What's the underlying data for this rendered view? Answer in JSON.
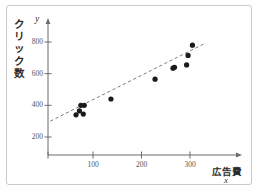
{
  "chart_data": {
    "type": "scatter",
    "title": "",
    "xlabel": "広告費",
    "xvar": "x",
    "ylabel": "クリック数",
    "yvar": "y",
    "ylabel_chars": [
      "ク",
      "リ",
      "ッ",
      "ク",
      "数"
    ],
    "xlim": [
      0,
      340
    ],
    "ylim": [
      0,
      900
    ],
    "xticks": [
      100,
      200,
      300
    ],
    "xticklabels": [
      "100",
      "200",
      "300"
    ],
    "yticks": [
      200,
      400,
      600,
      800
    ],
    "yticklabels": [
      "200",
      "400",
      "600",
      "800"
    ],
    "grid": false,
    "legend": null,
    "point_color": "#1a1a1a",
    "line_color": "#7a7a7a",
    "axis_color": "#6b6b6b",
    "points": [
      {
        "x": 65,
        "y": 340
      },
      {
        "x": 72,
        "y": 365
      },
      {
        "x": 75,
        "y": 400
      },
      {
        "x": 80,
        "y": 345
      },
      {
        "x": 82,
        "y": 400
      },
      {
        "x": 137,
        "y": 440
      },
      {
        "x": 228,
        "y": 565
      },
      {
        "x": 265,
        "y": 635
      },
      {
        "x": 268,
        "y": 640
      },
      {
        "x": 293,
        "y": 655
      },
      {
        "x": 296,
        "y": 715
      },
      {
        "x": 305,
        "y": 780
      }
    ],
    "trendline": {
      "style": "dashed",
      "x1": 12,
      "y1": 300,
      "x2": 330,
      "y2": 790
    }
  }
}
